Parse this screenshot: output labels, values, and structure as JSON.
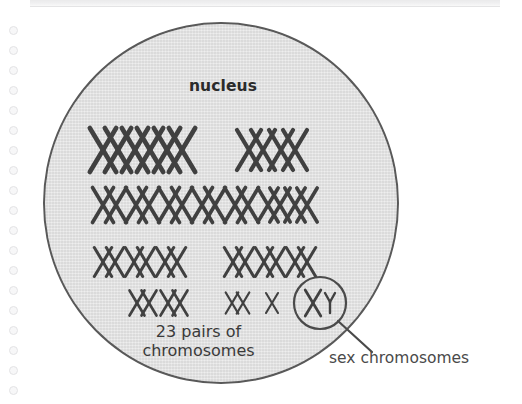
{
  "figure": {
    "title": "nucleus",
    "background_color": "#ffffff",
    "nucleus_fill": "#e4e4e4",
    "nucleus_stroke": "#595959",
    "chromosome_color": "#404040",
    "text_color": "#3a3a3a"
  },
  "labels": {
    "nucleus": "nucleus",
    "caption_line1": "23 pairs of",
    "caption_line2": "chromosomes",
    "sex_chromosomes": "sex chromosomes",
    "x_chromosome": "X",
    "y_chromosome": "Y"
  },
  "chart_data": {
    "type": "diagram",
    "title": "nucleus",
    "total_pairs": 23,
    "rows": [
      {
        "row": 1,
        "y": 150,
        "size": "large",
        "groups": [
          {
            "pairs": 3,
            "start_x": 103,
            "spacing": 32,
            "pair_gap": 15,
            "height": 44
          },
          {
            "pairs": 2,
            "start_x": 249,
            "spacing": 32,
            "pair_gap": 14,
            "height": 40
          }
        ]
      },
      {
        "row": 2,
        "y": 205,
        "size": "medium",
        "groups": [
          {
            "pairs": 5,
            "start_x": 103,
            "spacing": 33,
            "pair_gap": 13,
            "height": 35
          },
          {
            "pairs": 2,
            "start_x": 268,
            "spacing": 27,
            "pair_gap": 12,
            "height": 34
          }
        ]
      },
      {
        "row": 3,
        "y": 262,
        "size": "medium-small",
        "groups": [
          {
            "pairs": 3,
            "start_x": 103,
            "spacing": 31,
            "pair_gap": 12,
            "height": 29
          },
          {
            "pairs": 3,
            "start_x": 233,
            "spacing": 31,
            "pair_gap": 12,
            "height": 29
          }
        ]
      },
      {
        "row": 4,
        "y": 303,
        "size": "small",
        "groups": [
          {
            "pairs": 2,
            "start_x": 137,
            "spacing": 31,
            "pair_gap": 12,
            "height": 25
          },
          {
            "pairs": 1,
            "start_x": 232,
            "spacing": 30,
            "pair_gap": 11,
            "height": 21
          },
          {
            "singles": 1,
            "start_x": 272,
            "height": 20
          }
        ]
      }
    ],
    "sex_pair": {
      "circle_center_x": 320,
      "circle_center_y": 303,
      "circle_radius": 26,
      "x_label": "X",
      "y_label": "Y",
      "leader_line": {
        "x1": 338,
        "y1": 321,
        "x2": 372,
        "y2": 352
      }
    },
    "annotations": [
      {
        "text": "23 pairs of chromosomes",
        "target": "chromosome field"
      },
      {
        "text": "sex chromosomes",
        "target": "circled XY pair"
      }
    ]
  },
  "binding_holes": {
    "count": 19,
    "first_y": 10,
    "spacing": 20
  }
}
